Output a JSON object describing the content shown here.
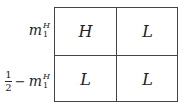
{
  "table": {
    "row_labels": [
      {
        "base": "m",
        "sup": "H",
        "sub": "1"
      },
      {
        "frac_num": "1",
        "frac_den": "2",
        "minus": "−",
        "base": "m",
        "sup": "H",
        "sub": "1"
      }
    ],
    "cells": [
      [
        "H",
        "L"
      ],
      [
        "L",
        "L"
      ]
    ]
  }
}
